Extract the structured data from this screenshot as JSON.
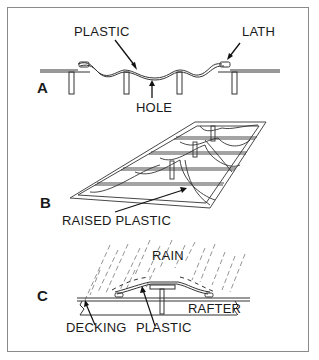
{
  "figure": {
    "panels": [
      {
        "letter": "A",
        "labels": {
          "plastic": "PLASTIC",
          "lath": "LATH",
          "hole": "HOLE"
        }
      },
      {
        "letter": "B",
        "labels": {
          "raised_plastic": "RAISED PLASTIC"
        }
      },
      {
        "letter": "C",
        "labels": {
          "rain": "RAIN",
          "rafter": "RAFTER",
          "decking": "DECKING",
          "plastic": "PLASTIC"
        }
      }
    ]
  },
  "colors": {
    "line": "#333333",
    "frame": "#8a8a8a",
    "background": "#ffffff"
  }
}
